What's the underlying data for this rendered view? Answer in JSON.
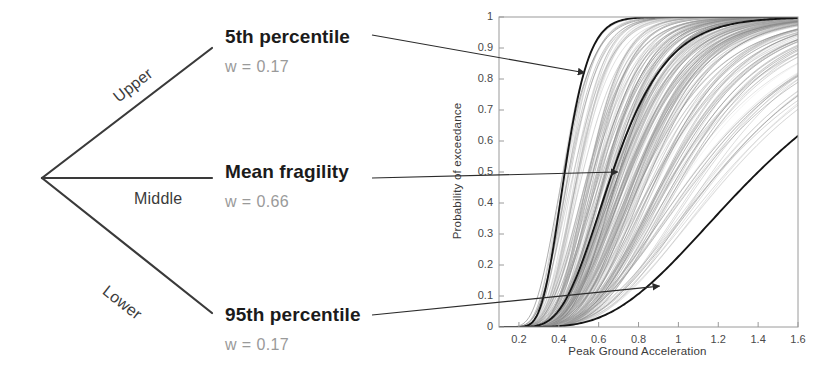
{
  "tree": {
    "root_label": "",
    "branches": [
      {
        "id": "upper",
        "branch_label": "Upper",
        "leaf_title": "5th percentile",
        "weight_text": "w = 0.17",
        "weight": 0.17
      },
      {
        "id": "middle",
        "branch_label": "Middle",
        "leaf_title": "Mean fragility",
        "weight_text": "w = 0.66",
        "weight": 0.66
      },
      {
        "id": "lower",
        "branch_label": "Lower",
        "leaf_title": "95th percentile",
        "weight_text": "w = 0.17",
        "weight": 0.17
      }
    ]
  },
  "chart_data": {
    "type": "line",
    "title": "",
    "xlabel": "Peak Ground Acceleration",
    "ylabel": "Probability of exceedance",
    "xlim": [
      0.1,
      1.6
    ],
    "ylim": [
      0,
      1
    ],
    "xticks": [
      0.2,
      0.4,
      0.6,
      0.8,
      1,
      1.2,
      1.4,
      1.6
    ],
    "xticklabels": [
      "0.2",
      "0.4",
      "0.6",
      "0.8",
      "1",
      "1.2",
      "1.4",
      "1.6"
    ],
    "yticks": [
      0,
      0.1,
      0.2,
      0.3,
      0.4,
      0.5,
      0.6,
      0.7,
      0.8,
      0.9,
      1
    ],
    "yticklabels": [
      "0",
      "0.1",
      "0.2",
      "0.3",
      "0.4",
      "0.5",
      "0.6",
      "0.7",
      "0.8",
      "0.9",
      "1"
    ],
    "grid": false,
    "legend": "none",
    "series": [
      {
        "name": "5th percentile",
        "style": "bold-black",
        "median_pga": 0.43,
        "beta": 0.22,
        "points_pga": [
          0.1,
          0.2,
          0.25,
          0.3,
          0.35,
          0.4,
          0.45,
          0.5,
          0.55,
          0.6,
          0.7,
          0.8,
          0.9,
          1.0,
          1.2,
          1.4,
          1.6
        ],
        "points_prob": [
          0.0,
          0.024,
          0.09,
          0.2,
          0.34,
          0.47,
          0.59,
          0.69,
          0.77,
          0.83,
          0.91,
          0.95,
          0.972,
          0.984,
          0.995,
          0.998,
          0.999
        ]
      },
      {
        "name": "Mean fragility",
        "style": "bold-black",
        "median_pga": 0.67,
        "beta": 0.32,
        "points_pga": [
          0.1,
          0.2,
          0.3,
          0.4,
          0.5,
          0.6,
          0.7,
          0.8,
          0.9,
          1.0,
          1.1,
          1.2,
          1.4,
          1.6
        ],
        "points_prob": [
          0.0,
          0.006,
          0.055,
          0.16,
          0.3,
          0.43,
          0.545,
          0.64,
          0.715,
          0.775,
          0.82,
          0.857,
          0.908,
          0.94
        ]
      },
      {
        "name": "95th percentile",
        "style": "bold-black",
        "median_pga": 1.4,
        "beta": 0.45,
        "points_pga": [
          0.1,
          0.2,
          0.3,
          0.4,
          0.5,
          0.6,
          0.7,
          0.8,
          0.9,
          1.0,
          1.1,
          1.2,
          1.3,
          1.4,
          1.5,
          1.6
        ],
        "points_prob": [
          0.0,
          0.0,
          0.003,
          0.013,
          0.033,
          0.062,
          0.098,
          0.14,
          0.185,
          0.232,
          0.28,
          0.328,
          0.375,
          0.42,
          0.505,
          0.64
        ]
      }
    ],
    "bundle": {
      "name": "Simulated fragility realizations",
      "style": "thin-grey",
      "count": 200,
      "median_pga_range": [
        0.4,
        1.45
      ],
      "beta_range": [
        0.2,
        0.48
      ]
    },
    "annotations": [
      {
        "label": "5th percentile",
        "target_pga": 0.53,
        "target_prob": 0.82
      },
      {
        "label": "Mean fragility",
        "target_pga": 0.695,
        "target_prob": 0.5
      },
      {
        "label": "95th percentile",
        "target_pga": 0.905,
        "target_prob": 0.132
      }
    ]
  }
}
